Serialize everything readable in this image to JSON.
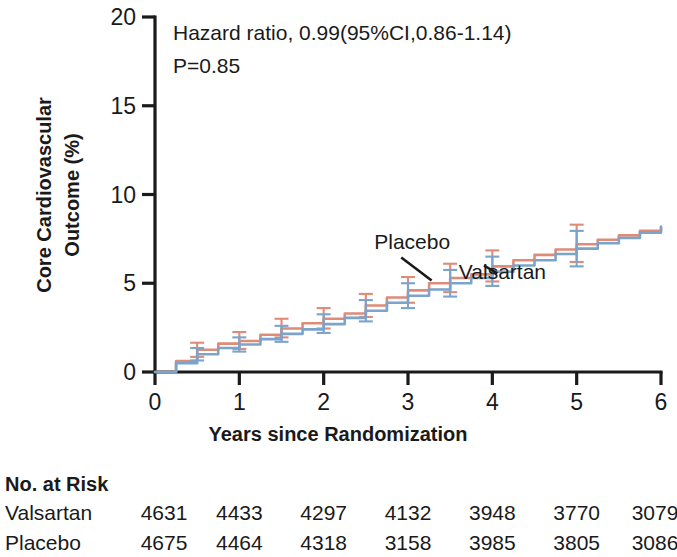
{
  "chart_data": {
    "type": "line",
    "title": "",
    "xlabel": "Years since Randomization",
    "ylabel": "Core Cardiovascular Outcome  (%)",
    "ylabel_line1": "Core Cardiovascular",
    "ylabel_line2": "Outcome  (%)",
    "xlim": [
      0,
      6
    ],
    "ylim": [
      0,
      20
    ],
    "xticks": [
      0,
      1,
      2,
      3,
      4,
      5,
      6
    ],
    "xtick_labels": [
      "0",
      "1",
      "2",
      "3",
      "4",
      "5",
      "6"
    ],
    "yticks": [
      0,
      5,
      10,
      15,
      20
    ],
    "ytick_labels": [
      "0",
      "5",
      "10",
      "15",
      "20"
    ],
    "grid": false,
    "legend_position": "inline-annotation",
    "annotations": [
      "Hazard ratio, 0.99(95%CI,0.86-1.14)",
      "P=0.85"
    ],
    "series": [
      {
        "name": "Placebo",
        "color": "#DE8B77",
        "label_x": 3.05,
        "label_y": 6.95,
        "x": [
          0,
          0.25,
          0.5,
          0.75,
          1.0,
          1.25,
          1.5,
          1.75,
          2.0,
          2.25,
          2.5,
          2.75,
          3.0,
          3.25,
          3.5,
          3.75,
          4.0,
          4.25,
          4.5,
          4.75,
          5.0,
          5.25,
          5.5,
          5.75,
          6.0
        ],
        "y": [
          0.0,
          0.62,
          1.25,
          1.6,
          1.75,
          2.1,
          2.45,
          2.75,
          3.0,
          3.3,
          3.75,
          4.2,
          4.6,
          5.0,
          5.3,
          5.5,
          5.95,
          6.3,
          6.6,
          6.9,
          7.2,
          7.45,
          7.7,
          7.95,
          8.2
        ],
        "error_bars": [
          {
            "x": 0.5,
            "y": 1.25,
            "lower": 0.85,
            "upper": 1.65
          },
          {
            "x": 1.0,
            "y": 1.75,
            "lower": 1.3,
            "upper": 2.25
          },
          {
            "x": 1.5,
            "y": 2.45,
            "lower": 1.95,
            "upper": 3.0
          },
          {
            "x": 2.0,
            "y": 3.0,
            "lower": 2.45,
            "upper": 3.6
          },
          {
            "x": 2.5,
            "y": 3.75,
            "lower": 3.1,
            "upper": 4.4
          },
          {
            "x": 3.0,
            "y": 4.6,
            "lower": 3.9,
            "upper": 5.35
          },
          {
            "x": 3.5,
            "y": 5.3,
            "lower": 4.5,
            "upper": 6.1
          },
          {
            "x": 4.0,
            "y": 5.95,
            "lower": 5.1,
            "upper": 6.85
          },
          {
            "x": 5.0,
            "y": 7.2,
            "lower": 6.2,
            "upper": 8.3
          }
        ]
      },
      {
        "name": "Valsartan",
        "color": "#7BA3CC",
        "label_x": 4.12,
        "label_y": 5.25,
        "x": [
          0,
          0.25,
          0.5,
          0.75,
          1.0,
          1.25,
          1.5,
          1.75,
          2.0,
          2.25,
          2.5,
          2.75,
          3.0,
          3.25,
          3.5,
          3.75,
          4.0,
          4.25,
          4.5,
          4.75,
          5.0,
          5.25,
          5.5,
          5.75,
          6.0
        ],
        "y": [
          0.0,
          0.5,
          1.0,
          1.35,
          1.55,
          1.85,
          2.15,
          2.4,
          2.7,
          3.05,
          3.45,
          3.9,
          4.3,
          4.65,
          5.0,
          5.3,
          5.65,
          6.0,
          6.3,
          6.65,
          6.95,
          7.25,
          7.55,
          7.85,
          8.15
        ],
        "error_bars": [
          {
            "x": 0.5,
            "y": 1.0,
            "lower": 0.65,
            "upper": 1.35
          },
          {
            "x": 1.0,
            "y": 1.55,
            "lower": 1.15,
            "upper": 1.95
          },
          {
            "x": 1.5,
            "y": 2.15,
            "lower": 1.7,
            "upper": 2.6
          },
          {
            "x": 2.0,
            "y": 2.7,
            "lower": 2.2,
            "upper": 3.25
          },
          {
            "x": 2.5,
            "y": 3.45,
            "lower": 2.85,
            "upper": 4.05
          },
          {
            "x": 3.0,
            "y": 4.3,
            "lower": 3.6,
            "upper": 5.0
          },
          {
            "x": 3.5,
            "y": 5.0,
            "lower": 4.25,
            "upper": 5.75
          },
          {
            "x": 4.0,
            "y": 5.65,
            "lower": 4.85,
            "upper": 6.5
          },
          {
            "x": 5.0,
            "y": 6.95,
            "lower": 5.95,
            "upper": 7.95
          }
        ]
      }
    ]
  },
  "risk_table": {
    "heading": "No. at Risk",
    "rows": [
      {
        "label": "Valsartan",
        "values": [
          "4631",
          "4433",
          "4297",
          "4132",
          "3948",
          "3770",
          "3079"
        ]
      },
      {
        "label": "Placebo",
        "values": [
          "4675",
          "4464",
          "4318",
          "3158",
          "3985",
          "3805",
          "3086"
        ]
      }
    ]
  }
}
